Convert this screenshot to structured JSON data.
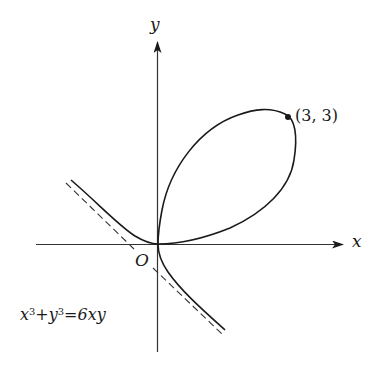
{
  "figure": {
    "equation": {
      "x": "x",
      "exp1": "3",
      "plus": "+",
      "y": "y",
      "exp2": "3",
      "eq": "=",
      "rhs": "6xy"
    },
    "axes": {
      "x_label": "x",
      "y_label": "y",
      "origin_label": "O"
    },
    "point": {
      "label": "(3, 3)",
      "x": 3,
      "y": 3
    },
    "asymptote": {
      "equation": "x + y = -2",
      "style": "dashed"
    },
    "colors": {
      "stroke": "#1a1a1a",
      "axis": "#333333",
      "background": "#ffffff"
    }
  }
}
